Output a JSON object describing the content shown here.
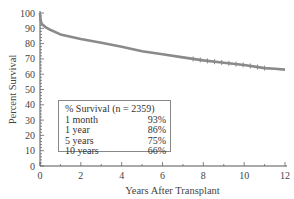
{
  "chart_data": {
    "type": "line",
    "title": "",
    "xlabel": "Years After Transplant",
    "ylabel": "Percent Survival",
    "xlim": [
      0,
      12
    ],
    "ylim": [
      0,
      100
    ],
    "x_ticks": [
      "0",
      "2",
      "4",
      "6",
      "8",
      "10",
      "12"
    ],
    "y_ticks": [
      "0",
      "10",
      "20",
      "30",
      "40",
      "50",
      "60",
      "70",
      "80",
      "90",
      "100"
    ],
    "grid": false,
    "series": [
      {
        "name": "Kaplan-Meier survival",
        "color": "#8a8a8a",
        "x": [
          0,
          0.02,
          0.08,
          0.25,
          0.5,
          1,
          2,
          3,
          4,
          5,
          6,
          7,
          8,
          9,
          10,
          11,
          11.5,
          12
        ],
        "y": [
          100,
          96,
          93,
          91,
          89,
          86,
          83,
          80.5,
          78,
          75,
          73,
          71,
          69,
          67.5,
          66,
          64,
          63.5,
          63
        ]
      }
    ],
    "legend": {
      "title": "% Survival  (n = 2359)",
      "entries": [
        {
          "label": "1 month",
          "value": "93%"
        },
        {
          "label": "1 year",
          "value": "86%"
        },
        {
          "label": "5 years",
          "value": "75%"
        },
        {
          "label": "10 years",
          "value": "66%"
        }
      ],
      "position": "lower-left inside"
    }
  }
}
